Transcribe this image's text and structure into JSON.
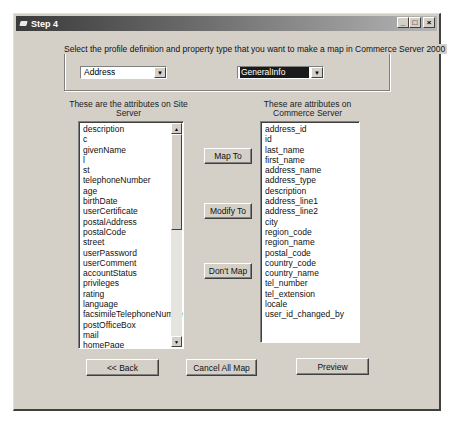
{
  "window": {
    "title": "Step 4",
    "controls": {
      "minimize": "_",
      "maximize": "□",
      "close": "×"
    }
  },
  "selection": {
    "legend": "Select the profile definition and property type that you want to make a map in Commerce Server 2000",
    "profile_definition": "Address",
    "property_type": "GeneralInfo"
  },
  "site_server": {
    "heading": "These are the attributes on Site Server",
    "items": [
      "description",
      "c",
      "givenName",
      "l",
      "st",
      "telephoneNumber",
      "age",
      "birthDate",
      "userCertificate",
      "postalAddress",
      "postalCode",
      "street",
      "userPassword",
      "userComment",
      "accountStatus",
      "privileges",
      "rating",
      "language",
      "facsimileTelephoneNumber",
      "postOfficeBox",
      "mail",
      "homePage",
      "ilsObject",
      "buddyList",
      "passwordReminder"
    ]
  },
  "commerce_server": {
    "heading": "These are attributes on Commerce Server",
    "items": [
      "address_id",
      "id",
      "last_name",
      "first_name",
      "address_name",
      "address_type",
      "description",
      "address_line1",
      "address_line2",
      "city",
      "region_code",
      "region_name",
      "postal_code",
      "country_code",
      "country_name",
      "tel_number",
      "tel_extension",
      "locale",
      "user_id_changed_by"
    ]
  },
  "actions": {
    "map_to": "Map To",
    "modify_to": "Modify To",
    "dont_map": "Don't Map"
  },
  "footer": {
    "back": "<< Back",
    "cancel_all_map": "Cancel All Map",
    "preview": "Preview"
  }
}
